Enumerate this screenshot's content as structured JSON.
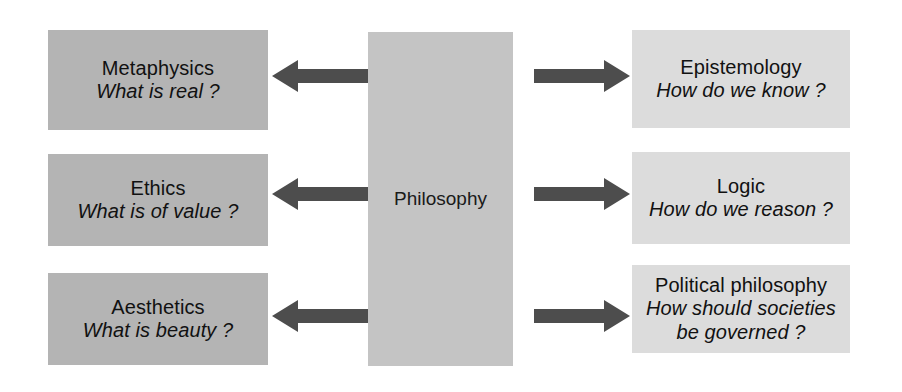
{
  "diagram": {
    "center": {
      "label": "Philosophy"
    },
    "colors": {
      "left_box_fill": "#b4b4b4",
      "right_box_fill": "#dcdcdc",
      "center_box_fill": "#c4c4c4",
      "arrow_fill": "#4d4d4d",
      "text": "#111111",
      "background": "#ffffff"
    },
    "left_branches": [
      {
        "name": "Metaphysics",
        "question": "What is real ?",
        "arrow_icon": "arrow-left-icon",
        "arrow_direction": "left"
      },
      {
        "name": "Ethics",
        "question": "What is of value ?",
        "arrow_icon": "arrow-left-icon",
        "arrow_direction": "left"
      },
      {
        "name": "Aesthetics",
        "question": "What is beauty ?",
        "arrow_icon": "arrow-left-icon",
        "arrow_direction": "left"
      }
    ],
    "right_branches": [
      {
        "name": "Epistemology",
        "question": "How do we know ?",
        "question_line_1": "How do we know ?",
        "question_line_2": "",
        "arrow_icon": "arrow-right-icon",
        "arrow_direction": "right"
      },
      {
        "name": "Logic",
        "question": "How do we reason ?",
        "question_line_1": "How do we reason ?",
        "question_line_2": "",
        "arrow_icon": "arrow-right-icon",
        "arrow_direction": "right"
      },
      {
        "name": "Political philosophy",
        "question": "How should societies be governed ?",
        "question_line_1": "How should societies",
        "question_line_2": "be governed ?",
        "arrow_icon": "arrow-right-icon",
        "arrow_direction": "right"
      }
    ]
  }
}
